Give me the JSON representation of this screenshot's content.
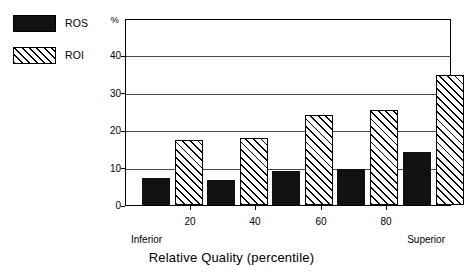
{
  "chart_data": {
    "type": "bar",
    "title": "",
    "xlabel": "Relative Quality (percentile)",
    "ylabel": "%",
    "categories": [
      "10",
      "30",
      "50",
      "70",
      "90"
    ],
    "series": [
      {
        "name": "ROS",
        "values": [
          7,
          6.5,
          9,
          9.5,
          14
        ],
        "fill": "solid-black"
      },
      {
        "name": "ROI",
        "values": [
          17,
          17.5,
          23.5,
          25,
          34
        ],
        "fill": "diagonal-hatch"
      }
    ],
    "ylim": [
      0,
      48.5
    ],
    "y_ticks": [
      0,
      10,
      20,
      30,
      40
    ],
    "y_tick_labels": [
      "0",
      "10",
      "20",
      "30",
      "40"
    ],
    "y_unit": "%",
    "xlim": [
      0,
      100
    ],
    "x_ticks": [
      20,
      40,
      60,
      80
    ],
    "x_tick_labels": [
      "20",
      "40",
      "60",
      "80"
    ],
    "x_end_labels": {
      "left": "Inferior",
      "right": "Superior"
    },
    "grid": "horizontal",
    "legend_position": "top-left"
  },
  "legend": {
    "items": [
      {
        "label": "ROS",
        "swatch": "solid-black-swatch"
      },
      {
        "label": "ROI",
        "swatch": "diagonal-hatch-swatch"
      }
    ]
  },
  "axis": {
    "y_unit": "%",
    "y_labels": [
      "40",
      "30",
      "20",
      "10",
      "0"
    ],
    "x_labels": [
      "20",
      "40",
      "60",
      "80"
    ],
    "x_left_end": "Inferior",
    "x_right_end": "Superior",
    "x_title": "Relative Quality (percentile)"
  },
  "colors": {
    "ros_fill": "#111111",
    "roi_fill": "#ffffff",
    "hatch_stroke": "#000000",
    "axis": "#000000",
    "gridline": "#4a4a4a",
    "background": "#ffffff"
  }
}
